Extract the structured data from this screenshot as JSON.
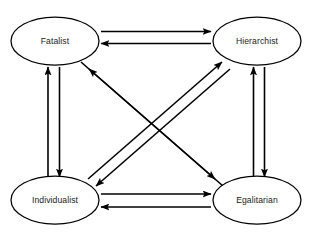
{
  "diagram": {
    "title": "",
    "type": "node-link-diagram",
    "background_color": "#ffffff",
    "stroke_color": "#000000",
    "text_color": "#1a1a1a",
    "nodes": [
      {
        "id": "fatalist",
        "label": "Fatalist",
        "cx": 55,
        "cy": 41,
        "rx": 44,
        "ry": 24
      },
      {
        "id": "hierarchist",
        "label": "Hierarchist",
        "cx": 257,
        "cy": 41,
        "rx": 44,
        "ry": 24
      },
      {
        "id": "individualist",
        "label": "Individualist",
        "cx": 55,
        "cy": 200,
        "rx": 44,
        "ry": 24
      },
      {
        "id": "egalitarian",
        "label": "Egalitarian",
        "cx": 257,
        "cy": 200,
        "rx": 44,
        "ry": 24
      }
    ],
    "edges": [
      {
        "id": "fatalist-to-hierarchist",
        "from": "fatalist",
        "to": "hierarchist",
        "direction": "right",
        "style": "straight-arrow"
      },
      {
        "id": "hierarchist-to-fatalist",
        "from": "hierarchist",
        "to": "fatalist",
        "direction": "left",
        "style": "straight-arrow"
      },
      {
        "id": "individualist-to-fatalist",
        "from": "individualist",
        "to": "fatalist",
        "direction": "up",
        "style": "straight-arrow"
      },
      {
        "id": "fatalist-to-individualist",
        "from": "fatalist",
        "to": "individualist",
        "direction": "down",
        "style": "straight-arrow"
      },
      {
        "id": "egalitarian-to-hierarchist",
        "from": "egalitarian",
        "to": "hierarchist",
        "direction": "up",
        "style": "straight-arrow"
      },
      {
        "id": "hierarchist-to-egalitarian",
        "from": "hierarchist",
        "to": "egalitarian",
        "direction": "down",
        "style": "straight-arrow"
      },
      {
        "id": "individualist-to-egalitarian",
        "from": "individualist",
        "to": "egalitarian",
        "direction": "right",
        "style": "straight-arrow"
      },
      {
        "id": "egalitarian-to-individualist",
        "from": "egalitarian",
        "to": "individualist",
        "direction": "left",
        "style": "straight-arrow"
      },
      {
        "id": "individualist-to-hierarchist",
        "from": "individualist",
        "to": "hierarchist",
        "direction": "up-right",
        "style": "diagonal-arrow"
      },
      {
        "id": "hierarchist-to-individualist",
        "from": "hierarchist",
        "to": "individualist",
        "direction": "down-left",
        "style": "diagonal-arrow"
      },
      {
        "id": "fatalist-to-egalitarian",
        "from": "fatalist",
        "to": "egalitarian",
        "direction": "down-right",
        "style": "diagonal-arrow"
      },
      {
        "id": "egalitarian-to-fatalist",
        "from": "egalitarian",
        "to": "fatalist",
        "direction": "up-left",
        "style": "diagonal-arrow"
      }
    ]
  }
}
